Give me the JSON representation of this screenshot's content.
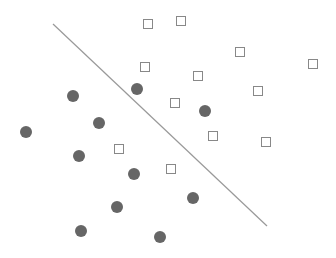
{
  "chart_data": {
    "type": "scatter",
    "title": "",
    "xlabel": "",
    "ylabel": "",
    "grid": false,
    "legend": null,
    "colors": {
      "circle_fill": "#666666",
      "square_stroke": "#888888",
      "line": "#999999",
      "background": "#ffffff"
    },
    "separator_line": {
      "x1": 53,
      "y1": 24,
      "x2": 267,
      "y2": 226
    },
    "series": [
      {
        "name": "circles",
        "marker": "filled-circle",
        "points": [
          [
            73,
            96
          ],
          [
            137,
            89
          ],
          [
            205,
            111
          ],
          [
            26,
            132
          ],
          [
            99,
            123
          ],
          [
            79,
            156
          ],
          [
            134,
            174
          ],
          [
            193,
            198
          ],
          [
            117,
            207
          ],
          [
            81,
            231
          ],
          [
            160,
            237
          ]
        ]
      },
      {
        "name": "squares",
        "marker": "hollow-square",
        "points": [
          [
            148,
            24
          ],
          [
            181,
            21
          ],
          [
            145,
            67
          ],
          [
            240,
            52
          ],
          [
            198,
            76
          ],
          [
            313,
            64
          ],
          [
            258,
            91
          ],
          [
            175,
            103
          ],
          [
            213,
            136
          ],
          [
            119,
            149
          ],
          [
            266,
            142
          ],
          [
            171,
            169
          ]
        ]
      }
    ]
  }
}
